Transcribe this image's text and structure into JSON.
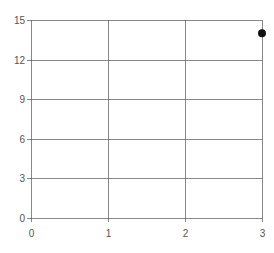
{
  "chart_data": {
    "type": "scatter",
    "title": "",
    "xlabel": "",
    "ylabel": "",
    "xlim": [
      0,
      3
    ],
    "ylim": [
      0,
      15
    ],
    "x_ticks": [
      0,
      1,
      2,
      3
    ],
    "x_tick_labels": [
      "0",
      "1",
      "2",
      "3"
    ],
    "y_ticks": [
      0,
      3,
      6,
      9,
      12,
      15
    ],
    "y_tick_labels": [
      "0",
      "3",
      "6",
      "9",
      "12",
      "15"
    ],
    "grid": true,
    "legend": null,
    "series": [
      {
        "name": "",
        "x": [
          3
        ],
        "y": [
          14
        ],
        "color": "#111111",
        "marker": "circle"
      }
    ]
  },
  "style": {
    "grid_color": "#555555",
    "tick_label_color": "#555555",
    "point_color": "#111111"
  }
}
